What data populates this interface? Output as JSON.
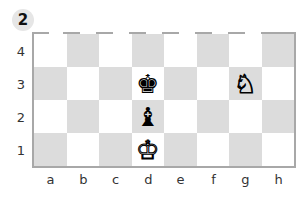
{
  "diagram": {
    "number": "2",
    "colors": {
      "dark_square": "#dcdcdc",
      "light_square": "#ffffff",
      "border": "#a8a8a8",
      "badge": "#e6e6e6"
    },
    "ranks": [
      "4",
      "3",
      "2",
      "1"
    ],
    "files": [
      "a",
      "b",
      "c",
      "d",
      "e",
      "f",
      "g",
      "h"
    ],
    "pieces": [
      {
        "square": "d3",
        "color": "black",
        "type": "king",
        "glyph": "♚"
      },
      {
        "square": "d2",
        "color": "black",
        "type": "bishop",
        "glyph": "♝"
      },
      {
        "square": "d1",
        "color": "white",
        "type": "king",
        "glyph": "♔"
      },
      {
        "square": "g3",
        "color": "white",
        "type": "knight",
        "glyph": "♘"
      }
    ]
  }
}
